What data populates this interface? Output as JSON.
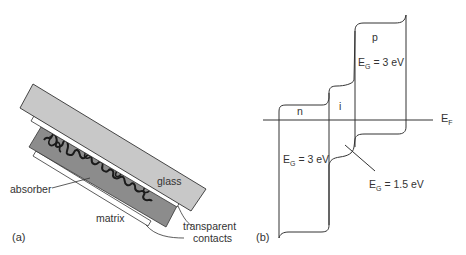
{
  "panel_a": {
    "label": "(a)",
    "parts": {
      "glass": "glass",
      "absorber": "absorber",
      "matrix": "matrix",
      "contacts_line1": "transparent",
      "contacts_line2": "contacts"
    },
    "colors": {
      "glass": "#c8c8c8",
      "matrix": "#8c8c8c",
      "contact": "#ffffff",
      "outline": "#333333",
      "absorber_squiggle": "#1a1a1a"
    }
  },
  "panel_b": {
    "label": "(b)",
    "regions": {
      "n": "n",
      "i": "i",
      "p": "p"
    },
    "fermi_level": {
      "main": "E",
      "sub": "F"
    },
    "bandgaps": {
      "p": {
        "main": "E",
        "sub": "G",
        "value": " = 3 eV"
      },
      "n": {
        "main": "E",
        "sub": "G",
        "value": " = 3 eV"
      },
      "i": {
        "main": "E",
        "sub": "G",
        "value": " = 1.5 eV"
      }
    }
  }
}
